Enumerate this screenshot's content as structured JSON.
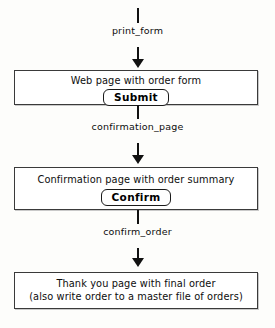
{
  "diagram": {
    "background_color": "#fdfdfb",
    "line_color": "#111111",
    "box_border_color": "#3a3a3a",
    "box_fill_color": "#ffffff",
    "edges": [
      {
        "label": "print_form"
      },
      {
        "label": "confirmation_page"
      },
      {
        "label": "confirm_order"
      }
    ],
    "nodes": [
      {
        "lines": [
          "Web page with order form"
        ],
        "button": "Submit"
      },
      {
        "lines": [
          "Confirmation page with order summary"
        ],
        "button": "Confirm"
      },
      {
        "lines": [
          "Thank you page with final order",
          "(also write order to a master file of orders)"
        ],
        "button": null
      }
    ]
  }
}
